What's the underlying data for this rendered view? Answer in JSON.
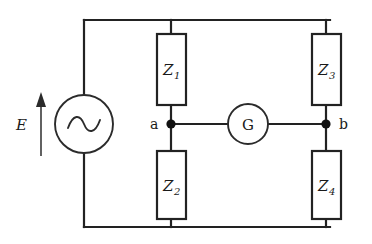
{
  "diagram": {
    "type": "circuit-schematic",
    "background_color": "#ffffff",
    "line_color": "#222222"
  },
  "source": {
    "label": "E",
    "symbol": "ac-source-sine",
    "arrow_direction": "up"
  },
  "detector": {
    "label": "G",
    "symbol": "galvanometer"
  },
  "nodes": [
    {
      "id": "a",
      "label": "a"
    },
    {
      "id": "b",
      "label": "b"
    }
  ],
  "impedances": [
    {
      "id": "Z1",
      "base": "Z",
      "sub": "1"
    },
    {
      "id": "Z2",
      "base": "Z",
      "sub": "2"
    },
    {
      "id": "Z3",
      "base": "Z",
      "sub": "3"
    },
    {
      "id": "Z4",
      "base": "Z",
      "sub": "4"
    }
  ]
}
